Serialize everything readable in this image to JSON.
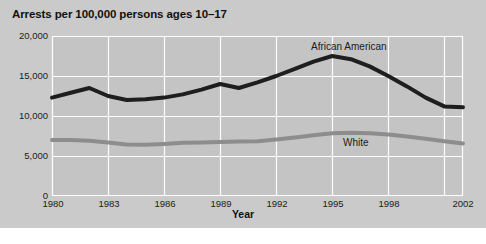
{
  "chart": {
    "title": "Arrests per 100,000 persons ages 10–17",
    "xlabel": "Year",
    "series_labels": {
      "african_american": "African American",
      "white": "White"
    }
  },
  "chart_data": {
    "type": "line",
    "title": "Arrests per 100,000 persons ages 10–17",
    "xlabel": "Year",
    "ylabel": "",
    "xlim": [
      1980,
      2002
    ],
    "ylim": [
      0,
      20000
    ],
    "grid": true,
    "legend_position": "inline-annotations",
    "xticks": [
      1980,
      1983,
      1986,
      1989,
      1992,
      1995,
      1998,
      2002
    ],
    "xtick_labels": [
      "1980",
      "1983",
      "1986",
      "1989",
      "1992",
      "1995",
      "1998",
      "2002"
    ],
    "yticks": [
      0,
      5000,
      10000,
      15000,
      20000
    ],
    "ytick_labels": [
      "0",
      "5,000",
      "10,000",
      "15,000",
      "20,000"
    ],
    "x": [
      1980,
      1981,
      1982,
      1983,
      1984,
      1985,
      1986,
      1987,
      1988,
      1989,
      1990,
      1991,
      1992,
      1993,
      1994,
      1995,
      1996,
      1997,
      1998,
      1999,
      2000,
      2001,
      2002
    ],
    "series": [
      {
        "name": "African American",
        "color": "#1e1e1e",
        "values": [
          12300,
          12900,
          13500,
          12500,
          12000,
          12100,
          12300,
          12700,
          13300,
          14000,
          13500,
          14200,
          15000,
          15900,
          16800,
          17500,
          17100,
          16200,
          15000,
          13700,
          12300,
          11200,
          11100
        ]
      },
      {
        "name": "White",
        "color": "#8d8d8d",
        "values": [
          7000,
          7000,
          6900,
          6700,
          6450,
          6400,
          6500,
          6650,
          6700,
          6750,
          6800,
          6850,
          7050,
          7300,
          7600,
          7850,
          7900,
          7850,
          7700,
          7450,
          7150,
          6850,
          6550
        ]
      }
    ]
  }
}
